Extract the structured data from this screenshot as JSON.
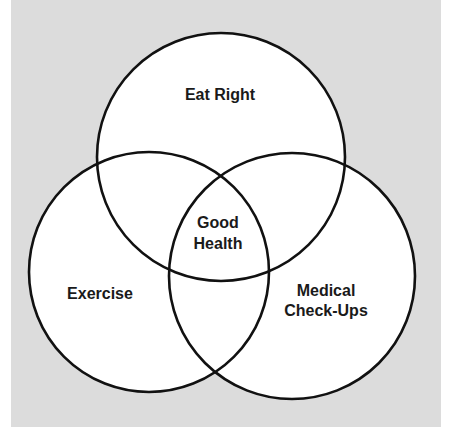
{
  "diagram": {
    "type": "venn",
    "background_color": "#dcdcdc",
    "circle_fill": "#ffffff",
    "stroke_color": "#111111",
    "sets": [
      {
        "id": "top",
        "label_lines": [
          "Eat Right"
        ]
      },
      {
        "id": "left",
        "label_lines": [
          "Exercise"
        ]
      },
      {
        "id": "right",
        "label_lines": [
          "Medical",
          "Check-Ups"
        ]
      }
    ],
    "center": {
      "label_lines": [
        "Good",
        "Health"
      ]
    }
  },
  "labels": {
    "eat_right": "Eat Right",
    "exercise": "Exercise",
    "medical_line1": "Medical",
    "medical_line2": "Check-Ups",
    "good": "Good",
    "health": "Health"
  }
}
